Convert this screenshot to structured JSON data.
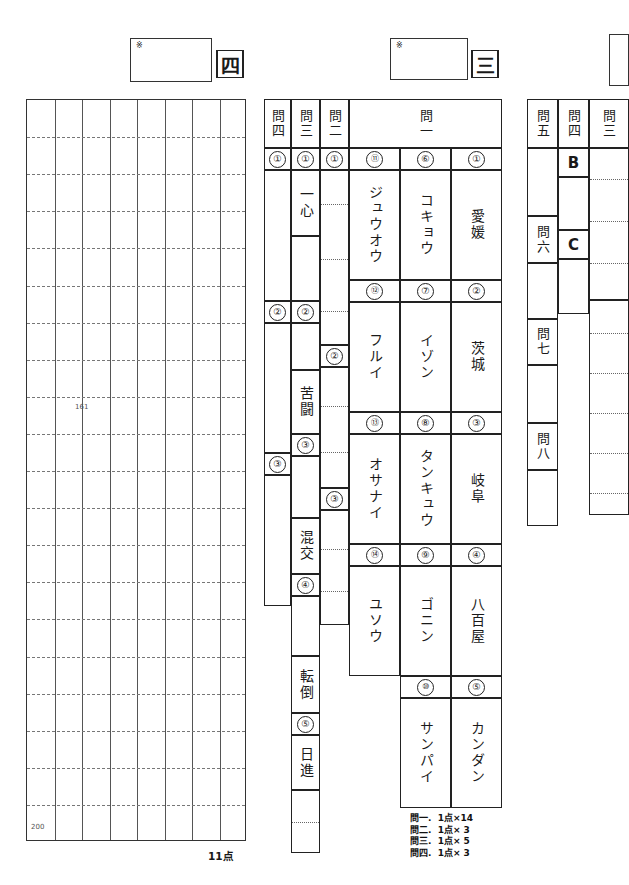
{
  "page": {
    "total_label": "11点"
  },
  "section_four": {
    "badge": "四",
    "mark": "※",
    "grid": {
      "columns": 8,
      "rows": 20,
      "start_marker": "161",
      "end_marker": "200"
    }
  },
  "section_three": {
    "badge": "三",
    "mark": "※",
    "headers": {
      "mon_ichi": "問一",
      "mon_ni": "問二",
      "mon_san": "問三",
      "mon_yon": "問四"
    },
    "mon_ichi": {
      "col_right": [
        {
          "num": "①",
          "answer": "愛媛"
        },
        {
          "num": "②",
          "answer": "茨城"
        },
        {
          "num": "③",
          "answer": "岐阜"
        },
        {
          "num": "④",
          "answer": "八百屋"
        },
        {
          "num": "⑤",
          "answer": "カンダン"
        }
      ],
      "col_mid": [
        {
          "num": "⑥",
          "answer": "コキョウ"
        },
        {
          "num": "⑦",
          "answer": "イゾン"
        },
        {
          "num": "⑧",
          "answer": "タンキュウ"
        },
        {
          "num": "⑨",
          "answer": "ゴニン"
        },
        {
          "num": "⑩",
          "answer": "サンパイ"
        }
      ],
      "col_left": [
        {
          "num": "⑪",
          "answer": "ジュウオウ"
        },
        {
          "num": "⑫",
          "answer": "フルイ"
        },
        {
          "num": "⑬",
          "answer": "オサナイ"
        },
        {
          "num": "⑭",
          "answer": "ユソウ"
        }
      ]
    },
    "mon_ni": [
      {
        "num": "①",
        "answer": ""
      },
      {
        "num": "②",
        "answer": ""
      },
      {
        "num": "③",
        "answer": ""
      }
    ],
    "mon_san": [
      {
        "num": "①",
        "answer": "一心"
      },
      {
        "num": "②",
        "answer": "苦闘"
      },
      {
        "num": "③",
        "answer": "混交"
      },
      {
        "num": "④",
        "answer": "転倒"
      },
      {
        "num": "⑤",
        "answer": "日進"
      }
    ],
    "mon_yon": [
      {
        "num": "①",
        "answer": ""
      },
      {
        "num": "②",
        "answer": ""
      },
      {
        "num": "③",
        "answer": ""
      }
    ],
    "scoring": [
      "問一.  1点×14",
      "問二.  1点× 3",
      "問三.  1点× 5",
      "問四.  1点× 3"
    ]
  },
  "section_right": {
    "headers": {
      "mon_san": "問三",
      "mon_yon": "問四",
      "mon_go": "問五",
      "mon_roku": "問六",
      "mon_shichi": "問七",
      "mon_hachi": "問八"
    },
    "answers": {
      "b": "B",
      "c": "C"
    }
  }
}
